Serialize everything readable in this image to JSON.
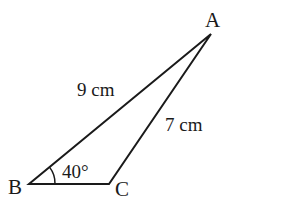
{
  "diagram": {
    "type": "triangle",
    "vertices": {
      "A": {
        "label": "A",
        "x": 211,
        "y": 34
      },
      "B": {
        "label": "B",
        "x": 29,
        "y": 184
      },
      "C": {
        "label": "C",
        "x": 109,
        "y": 184
      }
    },
    "sides": {
      "AB": {
        "label": "9 cm"
      },
      "AC": {
        "label": "7 cm"
      }
    },
    "angles": {
      "B": {
        "label": "40°"
      }
    },
    "colors": {
      "stroke": "#1a1a1a",
      "background": "#ffffff"
    }
  }
}
